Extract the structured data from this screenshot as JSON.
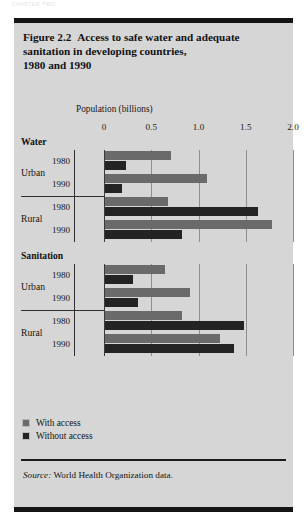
{
  "page_header": "CHAPTER  TWO",
  "figure": {
    "number": "Figure 2.2",
    "title": "Access to safe water and adequate sanitation in developing countries, 1980 and 1990",
    "title_line1": "Access to safe water and adequate",
    "title_line2": "sanitation in developing countries,",
    "title_line3": "1980 and 1990",
    "source_label": "Source:",
    "source_text": "World Health Organization data."
  },
  "legend": {
    "items": [
      {
        "label": "With access",
        "color": "#6a6a6a"
      },
      {
        "label": "Without access",
        "color": "#232323"
      }
    ]
  },
  "chart_data": {
    "type": "bar",
    "orientation": "horizontal",
    "xlabel": "Population (billions)",
    "ylabel": "",
    "xlim": [
      0,
      2.0
    ],
    "xticks": [
      0,
      0.5,
      1.0,
      1.5,
      2.0
    ],
    "xticklabels": [
      "0",
      "0.5",
      "1.0",
      "1.5",
      "2.0"
    ],
    "grid": true,
    "legend_position": "below-plot-left",
    "series": [
      {
        "name": "With access",
        "color": "#6a6a6a"
      },
      {
        "name": "Without access",
        "color": "#232323"
      }
    ],
    "sections": [
      {
        "name": "Water",
        "groups": [
          {
            "name": "Urban",
            "rows": [
              {
                "year": "1980",
                "with_access": 0.7,
                "without_access": 0.22
              },
              {
                "year": "1990",
                "with_access": 1.08,
                "without_access": 0.18
              }
            ]
          },
          {
            "name": "Rural",
            "rows": [
              {
                "year": "1980",
                "with_access": 0.67,
                "without_access": 1.62
              },
              {
                "year": "1990",
                "with_access": 1.77,
                "without_access": 0.81
              }
            ]
          }
        ]
      },
      {
        "name": "Sanitation",
        "groups": [
          {
            "name": "Urban",
            "rows": [
              {
                "year": "1980",
                "with_access": 0.63,
                "without_access": 0.3
              },
              {
                "year": "1990",
                "with_access": 0.9,
                "without_access": 0.35
              }
            ]
          },
          {
            "name": "Rural",
            "rows": [
              {
                "year": "1980",
                "with_access": 0.81,
                "without_access": 1.47
              },
              {
                "year": "1990",
                "with_access": 1.22,
                "without_access": 1.36
              }
            ]
          }
        ]
      }
    ]
  }
}
